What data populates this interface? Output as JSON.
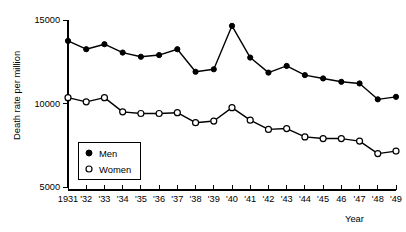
{
  "chart_data": {
    "type": "line",
    "title": "",
    "xlabel": "Year",
    "ylabel": "Death rate per million",
    "x": [
      1931,
      1932,
      1933,
      1934,
      1935,
      1936,
      1937,
      1938,
      1939,
      1940,
      1941,
      1942,
      1943,
      1944,
      1945,
      1946,
      1947,
      1948,
      1949
    ],
    "xtick_labels": [
      "1931",
      "'32",
      "'33",
      "'34",
      "'35",
      "'36",
      "'37",
      "'38",
      "'39",
      "'40",
      "'41",
      "'42",
      "'43",
      "'44",
      "'45",
      "46",
      "'47",
      "'48",
      "'49"
    ],
    "ytick_labels": [
      "5000",
      "10000",
      "15000"
    ],
    "ytick_values": [
      5000,
      10000,
      15000
    ],
    "ylim": [
      5000,
      15000
    ],
    "xlim": [
      1931,
      1949
    ],
    "grid": false,
    "legend_position": "inside-left",
    "series": [
      {
        "name": "Men",
        "marker": "filled-circle",
        "color": "#000000",
        "values": [
          13750,
          13250,
          13550,
          13050,
          12800,
          12900,
          13250,
          11900,
          12050,
          14650,
          12750,
          11850,
          12250,
          11700,
          11500,
          11300,
          11200,
          10250,
          10400
        ]
      },
      {
        "name": "Women",
        "marker": "open-circle",
        "color": "#000000",
        "values": [
          10350,
          10100,
          10350,
          9500,
          9400,
          9400,
          9450,
          8850,
          8950,
          9750,
          9000,
          8450,
          8500,
          8000,
          7900,
          7900,
          7750,
          7000,
          7150
        ]
      }
    ]
  },
  "legend": {
    "entries": [
      {
        "label": "Men",
        "marker": "filled-circle"
      },
      {
        "label": "Women",
        "marker": "open-circle"
      }
    ]
  },
  "axes": {
    "y_title": "Death rate per million",
    "x_title": "Year"
  }
}
